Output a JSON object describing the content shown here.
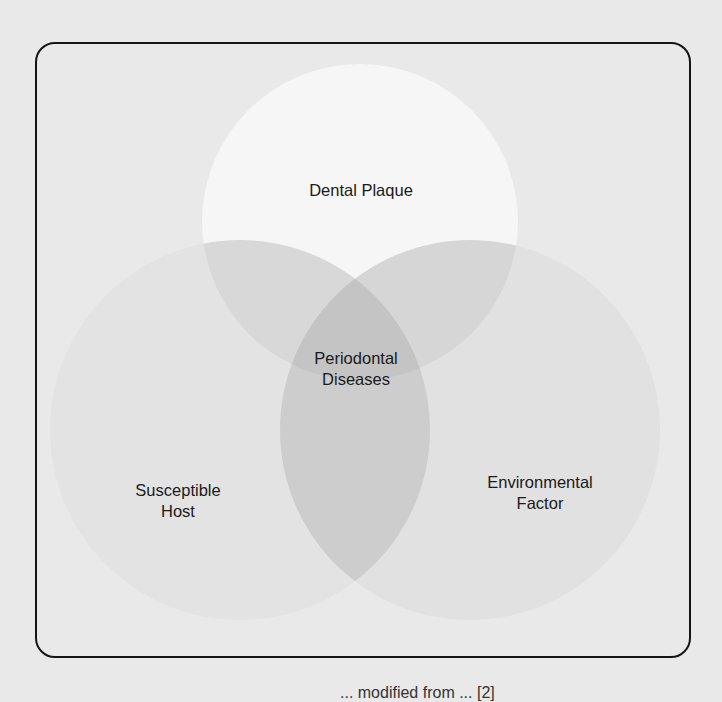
{
  "diagram": {
    "type": "venn",
    "sets": [
      {
        "id": "dental-plaque",
        "label": "Dental Plaque"
      },
      {
        "id": "susceptible-host",
        "label_line1": "Susceptible",
        "label_line2": "Host"
      },
      {
        "id": "environmental-factor",
        "label_line1": "Environmental",
        "label_line2": "Factor"
      }
    ],
    "intersection": {
      "label_line1": "Periodontal",
      "label_line2": "Diseases"
    },
    "caption": "... modified from ... [2]"
  },
  "colors": {
    "background": "#e9e9e9",
    "frame_border": "#151515",
    "top_circle": "#f6f6f6",
    "lower_circles": "#e4e4e4",
    "pair_overlap": "#d6d6d6",
    "triple_overlap": "#c6c6c6",
    "text": "#1a1a1a"
  }
}
